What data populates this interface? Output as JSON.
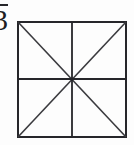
{
  "figure": {
    "background_color": "#fdfdfd",
    "stroke_color": "#26262a",
    "diagonal_color": "#3a3a3e",
    "square": {
      "x": 17,
      "y": 21,
      "width": 110,
      "height": 117,
      "border_width": 2
    },
    "center": {
      "x": 72,
      "y": 79
    },
    "lines": [
      {
        "name": "diagonal-tl-br",
        "x1": 17,
        "y1": 21,
        "x2": 127,
        "y2": 138
      },
      {
        "name": "diagonal-tr-bl",
        "x1": 127,
        "y1": 21,
        "x2": 17,
        "y2": 138
      },
      {
        "name": "midline-vertical",
        "x1": 72,
        "y1": 21,
        "x2": 72,
        "y2": 138
      },
      {
        "name": "midline-horizontal",
        "x1": 17,
        "y1": 79,
        "x2": 127,
        "y2": 79
      }
    ],
    "region_count": 8
  },
  "label": {
    "text": "3",
    "has_overline": true,
    "clipped": true,
    "description": "fraction denominator with bar, clipped at left edge"
  }
}
